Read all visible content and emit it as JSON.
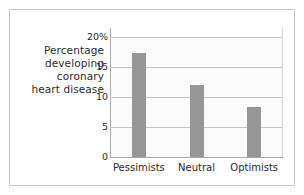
{
  "chart_data": {
    "type": "bar",
    "title": "",
    "subtitle": "",
    "xlabel": "",
    "ylabel": "Percentage developing coronary heart disease",
    "ylabel_lines": [
      "Percentage",
      "developing",
      "coronary",
      "heart disease"
    ],
    "categories": [
      "Pessimists",
      "Neutral",
      "Optimists"
    ],
    "values": [
      17.4,
      12.0,
      8.3
    ],
    "series": [
      {
        "name": "Percentage developing coronary heart disease",
        "values": [
          17.4,
          12.0,
          8.3
        ]
      }
    ],
    "ylim": [
      0,
      20
    ],
    "yticks": [
      0,
      5,
      10,
      15,
      20
    ],
    "ytick_labels": [
      "0",
      "5",
      "10",
      "15",
      "20%"
    ],
    "grid": true,
    "legend": false,
    "legend_position": "none",
    "bar_color": "#969696",
    "plot_background": "#fbfbfb",
    "gridline_color": "#c4c4c4",
    "text_color": "#2b2b2b",
    "frame_color": "#c9c9c9"
  }
}
